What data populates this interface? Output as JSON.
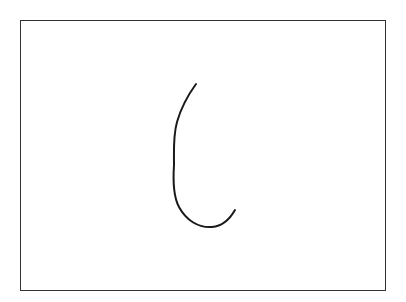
{
  "canvas": {
    "background": "#ffffff",
    "border_color": "#333333",
    "stroke_color": "#1a1a1a",
    "stroke_width": 2,
    "stroke_path": "M196,84 C188,95 181,108 177,122 C173,136 174,150 174,165 C173,180 173,196 179,207 C186,220 198,228 212,227 C224,226 231,217 235,210"
  }
}
